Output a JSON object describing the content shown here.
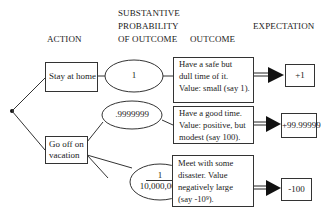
{
  "headers": {
    "action": "ACTION",
    "probability_line1": "SUBSTANTIVE",
    "probability_line2": "PROBABILITY",
    "probability_line3": "OF OUTCOME",
    "outcome": "OUTCOME",
    "expectation": "EXPECTATION"
  },
  "actions": [
    {
      "label": "Stay at home"
    },
    {
      "label_line1": "Go off on",
      "label_line2": "vacation"
    }
  ],
  "probabilities": [
    {
      "value": "1"
    },
    {
      "value": ".9999999"
    },
    {
      "numerator": "1",
      "denominator": "10,000,000"
    }
  ],
  "outcomes": [
    {
      "lines": [
        "Have a safe but",
        "dull time of it.",
        "Value:  small (say 1)."
      ]
    },
    {
      "lines": [
        "Have a good time.",
        "Value:  positive, but",
        "modest (say 100)."
      ]
    },
    {
      "lines": [
        "Meet with some",
        "disaster.  Value",
        "negatively large",
        "(say -10",
        "9",
        ")."
      ]
    }
  ],
  "expectations": [
    {
      "value": "+1"
    },
    {
      "value": "+99.99999"
    },
    {
      "value": "-100"
    }
  ],
  "colors": {
    "line": "#333333",
    "text": "#1a1a1a",
    "background": "#ffffff"
  }
}
